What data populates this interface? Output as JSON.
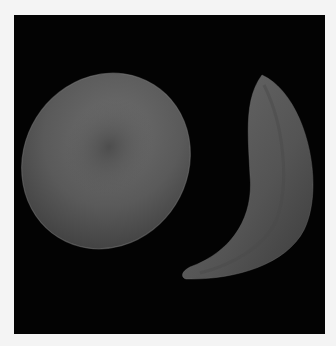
{
  "image": {
    "description": "Micrograph-style render of a normal red blood cell (biconcave disc) beside a sickle-shaped red blood cell on a black background",
    "subjects": [
      {
        "name": "normal-red-blood-cell",
        "shape": "biconcave disc"
      },
      {
        "name": "sickle-red-blood-cell",
        "shape": "crescent"
      }
    ],
    "colors": {
      "page_background": "#f4f4f4",
      "panel_background": "#030303",
      "cell_highlight": "#7a7a7a",
      "cell_mid": "#5a5a5a",
      "cell_shadow": "#2e2e2e"
    }
  }
}
